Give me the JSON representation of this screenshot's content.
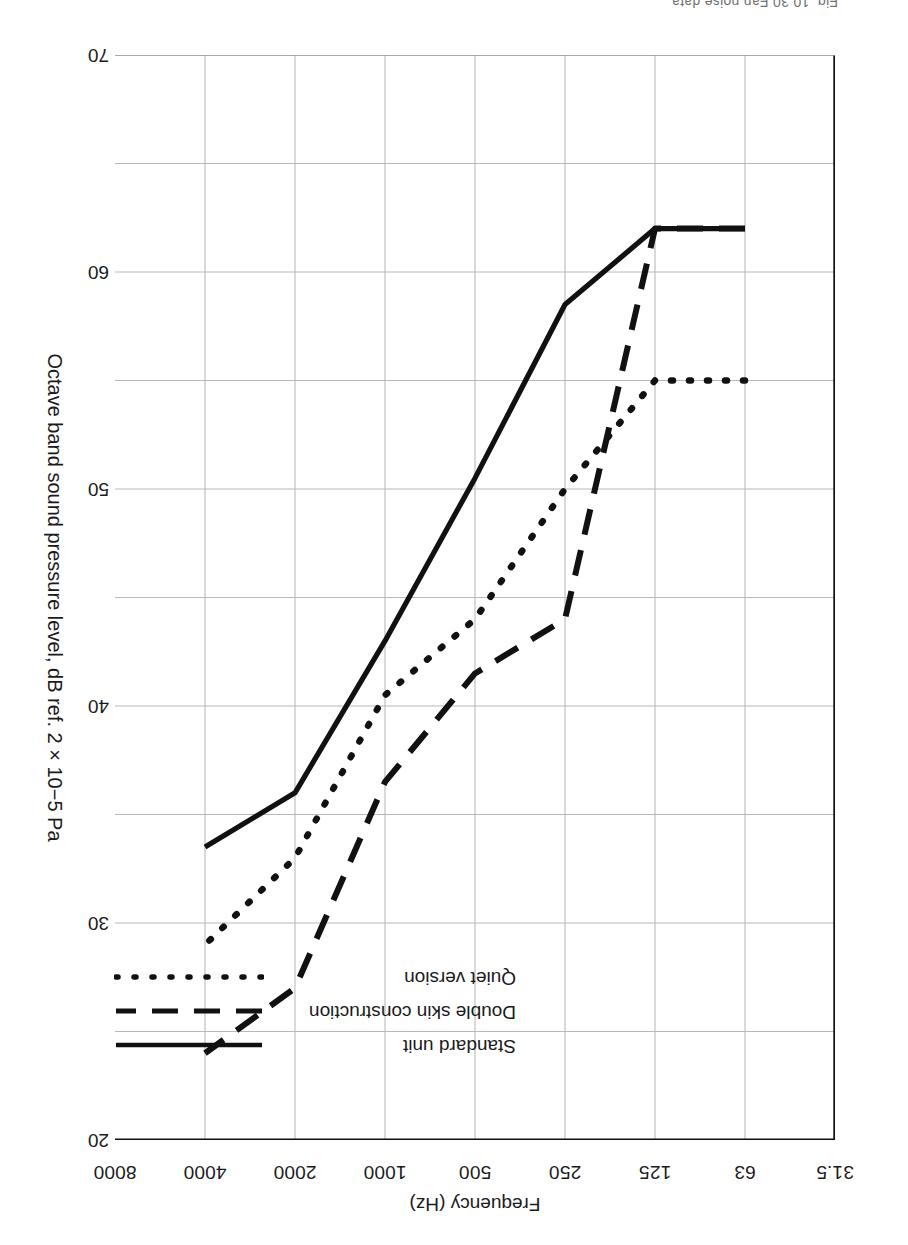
{
  "caption": "Fig. 10.30  Fan noise  data",
  "chart_data": {
    "type": "line",
    "title": "",
    "xlabel": "Frequency (Hz)",
    "ylabel": "Octave band sound pressure level, dB ref. 2 × 10−5 Pa",
    "x_scale": "log-octave",
    "categories": [
      "31.5",
      "63",
      "125",
      "250",
      "500",
      "1000",
      "2000",
      "4000",
      "8000"
    ],
    "xticklabels": [
      "31.5",
      "63",
      "125",
      "250",
      "500",
      "1000",
      "2000",
      "4000",
      "8000"
    ],
    "yticklabels": [
      "20",
      "30",
      "40",
      "50",
      "60",
      "70"
    ],
    "ylim": [
      20,
      70
    ],
    "y_axis_inverted": true,
    "ytick_step": 10,
    "gridline_step": 5,
    "grid": true,
    "legend_position": "upper-right-inside",
    "series": [
      {
        "name": "Standard unit",
        "style": "solid",
        "color": "#111111",
        "x": [
          "63",
          "125",
          "250",
          "500",
          "1000",
          "2000",
          "4000"
        ],
        "values": [
          62.0,
          62.0,
          58.5,
          50.5,
          43.0,
          36.0,
          33.5
        ]
      },
      {
        "name": "Double skin construction",
        "style": "dashed",
        "color": "#111111",
        "x": [
          "63",
          "125",
          "250",
          "500",
          "1000",
          "2000",
          "4000"
        ],
        "values": [
          62.0,
          62.0,
          44.0,
          41.5,
          36.5,
          27.0,
          24.0
        ]
      },
      {
        "name": "Quiet version",
        "style": "dotted",
        "color": "#111111",
        "x": [
          "63",
          "125",
          "250",
          "500",
          "1000",
          "2000",
          "4000"
        ],
        "values": [
          55.0,
          55.0,
          50.0,
          44.0,
          40.5,
          33.0,
          29.0
        ]
      }
    ]
  },
  "legend": {
    "items": [
      {
        "label": "Standard unit",
        "style": "solid"
      },
      {
        "label": "Double skin construction",
        "style": "dashed"
      },
      {
        "label": "Quiet version",
        "style": "dotted"
      }
    ]
  }
}
